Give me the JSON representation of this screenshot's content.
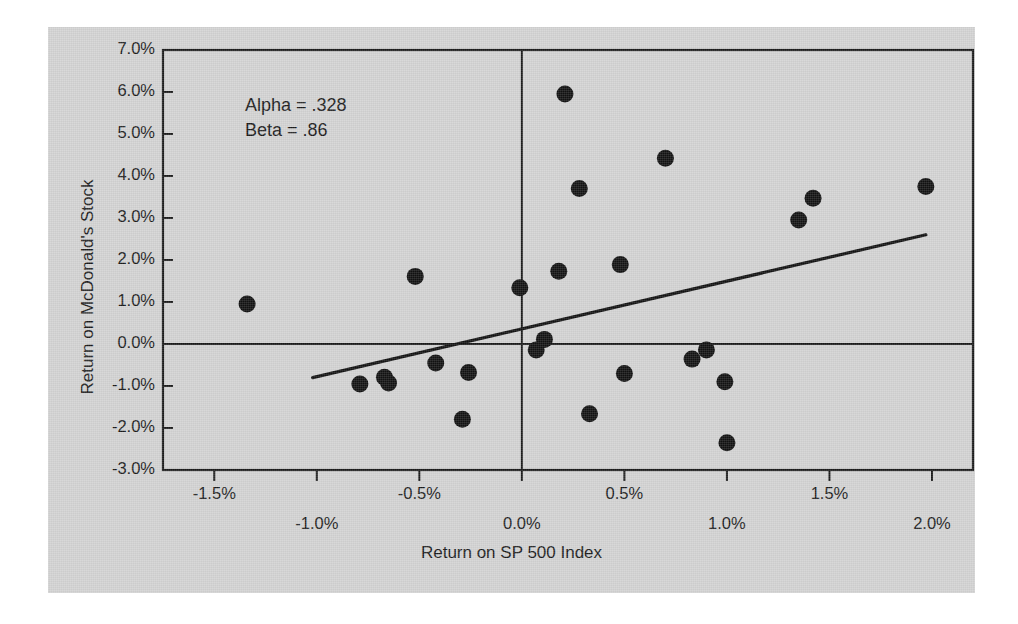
{
  "figure": {
    "background_color": "#d2d2d2",
    "page_color": "#ffffff",
    "ink_color": "#1a1a1a"
  },
  "chart_data": {
    "type": "scatter",
    "title": "",
    "xlabel": "Return on SP 500 Index",
    "ylabel": "Return on McDonald's Stock",
    "xlim": [
      -1.75,
      2.2
    ],
    "ylim": [
      -3.0,
      7.0
    ],
    "grid": false,
    "legend_position": "none",
    "x_tick_labels": [
      "-1.5%",
      "-1.0%",
      "-0.5%",
      "0.0%",
      "0.5%",
      "1.0%",
      "1.5%",
      "2.0%"
    ],
    "x_tick_values": [
      -1.5,
      -1.0,
      -0.5,
      0.0,
      0.5,
      1.0,
      1.5,
      2.0
    ],
    "y_tick_labels": [
      "7.0%",
      "6.0%",
      "5.0%",
      "4.0%",
      "3.0%",
      "2.0%",
      "1.0%",
      "0.0%",
      "-1.0%",
      "-2.0%",
      "-3.0%"
    ],
    "y_tick_values": [
      7.0,
      6.0,
      5.0,
      4.0,
      3.0,
      2.0,
      1.0,
      0.0,
      -1.0,
      -2.0,
      -3.0
    ],
    "zero_lines": {
      "x": 0.0,
      "y": 0.0
    },
    "annotations": [
      {
        "name": "alpha",
        "text": "Alpha = .328"
      },
      {
        "name": "beta",
        "text": "Beta = .86"
      }
    ],
    "series": [
      {
        "name": "Monthly returns",
        "marker": "filled-circle",
        "color": "#111111",
        "points": [
          {
            "x": -1.34,
            "y": 0.95
          },
          {
            "x": -0.79,
            "y": -0.95
          },
          {
            "x": -0.67,
            "y": -0.79
          },
          {
            "x": -0.65,
            "y": -0.93
          },
          {
            "x": -0.52,
            "y": 1.61
          },
          {
            "x": -0.42,
            "y": -0.45
          },
          {
            "x": -0.29,
            "y": -1.79
          },
          {
            "x": -0.26,
            "y": -0.68
          },
          {
            "x": -0.01,
            "y": 1.34
          },
          {
            "x": 0.07,
            "y": -0.14
          },
          {
            "x": 0.11,
            "y": 0.11
          },
          {
            "x": 0.18,
            "y": 1.73
          },
          {
            "x": 0.21,
            "y": 5.95
          },
          {
            "x": 0.28,
            "y": 3.7
          },
          {
            "x": 0.33,
            "y": -1.66
          },
          {
            "x": 0.48,
            "y": 1.89
          },
          {
            "x": 0.5,
            "y": -0.7
          },
          {
            "x": 0.7,
            "y": 4.42
          },
          {
            "x": 0.83,
            "y": -0.36
          },
          {
            "x": 0.9,
            "y": -0.14
          },
          {
            "x": 0.99,
            "y": -0.9
          },
          {
            "x": 1.0,
            "y": -2.35
          },
          {
            "x": 1.35,
            "y": 2.95
          },
          {
            "x": 1.42,
            "y": 3.47
          },
          {
            "x": 1.97,
            "y": 3.75
          }
        ]
      }
    ],
    "fit_line": {
      "name": "regression-line",
      "alpha": 0.328,
      "beta": 0.86,
      "x_start": -1.02,
      "y_start": -0.8,
      "x_end": 1.97,
      "y_end": 2.6,
      "color": "#111111"
    }
  }
}
